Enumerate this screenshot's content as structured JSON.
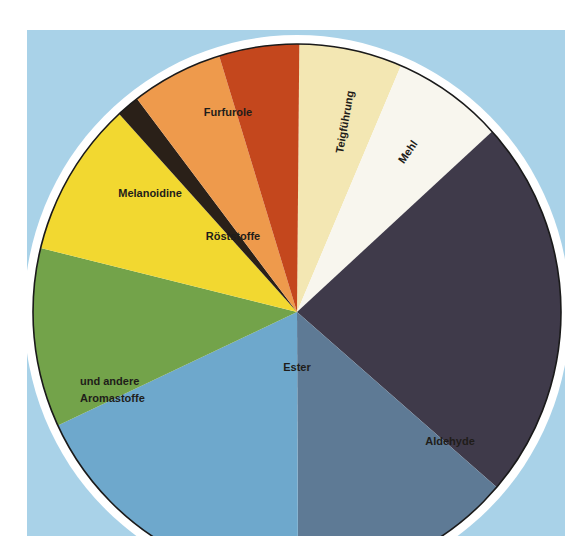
{
  "chart_data": {
    "type": "pie",
    "title": "",
    "start_angle_deg": 0.5,
    "direction": "clockwise",
    "background_color": "#a9d2e8",
    "categories": [
      "Teigführung",
      "Mehl",
      "Aldehyde (dunkel)",
      "Aldehyde",
      "Ester",
      "und andere Aromastoffe",
      "Melanoidine",
      "Röststoffe (schwarz)",
      "Furfurole / Röststoffe",
      "Furfurole (rot)"
    ],
    "values": [
      6.3,
      6.8,
      23.1,
      13.6,
      18.1,
      10.8,
      9.4,
      1.4,
      5.6,
      4.9
    ],
    "colors": [
      "#f3e7b3",
      "#f8f6ee",
      "#3f3a4a",
      "#5e7a95",
      "#6ea8cc",
      "#73a34a",
      "#f2d830",
      "#2a2018",
      "#ee9a4c",
      "#c4471d"
    ],
    "labels": [
      {
        "text": "Teigführung",
        "x": 345,
        "y": 122,
        "rotate": -80
      },
      {
        "text": "Mehl",
        "x": 408,
        "y": 152,
        "rotate": -55
      },
      {
        "text": "Aldehyde",
        "x": 450,
        "y": 441,
        "rotate": 0
      },
      {
        "text": "Ester",
        "x": 297,
        "y": 367,
        "rotate": 0
      },
      {
        "text": "und andere",
        "x": 118,
        "y": 382,
        "rotate": 0
      },
      {
        "text": "Aromastoffe",
        "x": 121,
        "y": 399,
        "rotate": 0
      },
      {
        "text": "Melanoidine",
        "x": 150,
        "y": 193,
        "rotate": 0
      },
      {
        "text": "Röststoffe",
        "x": 233,
        "y": 236,
        "rotate": 0
      },
      {
        "text": "Furfurole",
        "x": 228,
        "y": 112,
        "rotate": 0
      }
    ],
    "legend": "none",
    "grid": false
  },
  "labels": {
    "teig": "Teigführung",
    "mehl": "Mehl",
    "aldehyde": "Aldehyde",
    "ester": "Ester",
    "aroma1": "und andere",
    "aroma2": "Aromastoffe",
    "melanoidine": "Melanoidine",
    "roest": "Röststoffe",
    "furfurole": "Furfurole"
  }
}
